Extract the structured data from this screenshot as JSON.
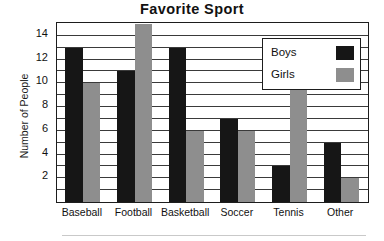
{
  "chart_data": {
    "type": "bar",
    "title": "Favorite Sport",
    "xlabel": "",
    "ylabel": "Number of People",
    "categories": [
      "Baseball",
      "Football",
      "Basketball",
      "Soccer",
      "Tennis",
      "Other"
    ],
    "series": [
      {
        "name": "Boys",
        "color": "#161616",
        "values": [
          13,
          11,
          13,
          7,
          3,
          5
        ]
      },
      {
        "name": "Girls",
        "color": "#8e8e8e",
        "values": [
          10,
          15,
          6,
          6,
          11,
          2
        ]
      }
    ],
    "ylim": [
      0,
      15
    ],
    "ytick_labels": [
      "2",
      "4",
      "6",
      "8",
      "10",
      "12",
      "14"
    ],
    "ytick_values": [
      2,
      4,
      6,
      8,
      10,
      12,
      14
    ],
    "grid": true,
    "grid_interval": 1,
    "legend_position": "top-right"
  },
  "legend": {
    "entries": [
      {
        "label": "Boys",
        "color": "#161616"
      },
      {
        "label": "Girls",
        "color": "#8e8e8e"
      }
    ]
  },
  "colors": {
    "boys": "#161616",
    "girls": "#8e8e8e",
    "axis": "#1d1d1d",
    "grid": "#3a3a3a",
    "text": "#111111",
    "background": "#ffffff"
  }
}
